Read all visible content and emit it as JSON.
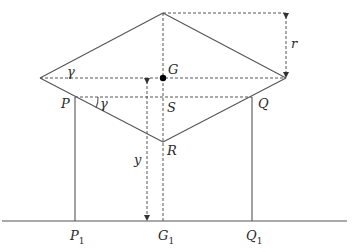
{
  "diagram": {
    "type": "geometry-figure",
    "labels": {
      "G": "G",
      "S": "S",
      "P": "P",
      "Q": "Q",
      "R": "R",
      "r": "r",
      "y": "y",
      "gamma_top": "γ",
      "gamma_P": "γ",
      "P1_base": "P",
      "P1_sub": "1",
      "G1_base": "G",
      "G1_sub": "1",
      "Q1_base": "Q",
      "Q1_sub": "1"
    },
    "points": {
      "top": [
        163,
        13
      ],
      "left": [
        40,
        78
      ],
      "right": [
        286,
        78
      ],
      "G": [
        163,
        78
      ],
      "P": [
        75,
        97
      ],
      "Q": [
        252,
        97
      ],
      "S": [
        163,
        97
      ],
      "R": [
        163,
        142
      ],
      "P1": [
        75,
        221
      ],
      "G1": [
        163,
        221
      ],
      "Q1": [
        252,
        221
      ]
    },
    "ground_line": {
      "x1": 2,
      "x2": 347,
      "y": 221
    },
    "colors": {
      "line": "#555555",
      "text": "#2a2a2a",
      "point": "#000000"
    }
  }
}
